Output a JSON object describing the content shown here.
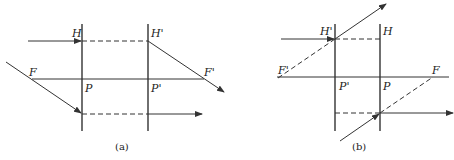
{
  "figure": {
    "type": "optics-principal-planes-diagram",
    "panels": [
      {
        "id": "a",
        "caption": "(a)",
        "labels": {
          "H": "H",
          "H_prime": "H'",
          "F": "F",
          "F_prime": "F'",
          "P": "P",
          "P_prime": "P'"
        },
        "description": "Converging system: object-side plane H at left, image-side plane H' at right"
      },
      {
        "id": "b",
        "caption": "(b)",
        "labels": {
          "H": "H",
          "H_prime": "H'",
          "F": "F",
          "F_prime": "F'",
          "P": "P",
          "P_prime": "P'"
        },
        "description": "Diverging system: H' at left, H at right, virtual foci shown with dashed rays"
      }
    ],
    "bottom_caption": ""
  },
  "colors": {
    "line": "#333333",
    "background": "#ffffff"
  }
}
